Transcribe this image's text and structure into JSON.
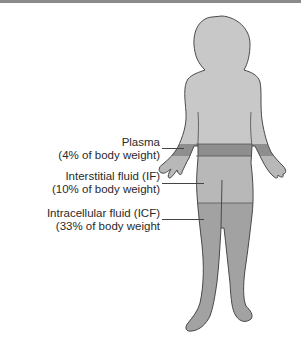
{
  "diagram": {
    "labels": [
      {
        "id": "plasma",
        "name": "Plasma",
        "detail": "(4% of body weight)"
      },
      {
        "id": "interstitial",
        "name": "Interstitial fluid (IF)",
        "detail": "(10% of body weight)"
      },
      {
        "id": "intracellular",
        "name": "Intracellular fluid (ICF)",
        "detail": "(33% of body weight"
      }
    ],
    "colors": {
      "body_base": "#c8c8c8",
      "plasma_band": "#8e8e8e",
      "interstitial_region": "#b8b8b8",
      "intracellular_region": "#a2a2a2",
      "outline": "#4a4a4a",
      "top_rule": "#8a8a8a"
    }
  }
}
